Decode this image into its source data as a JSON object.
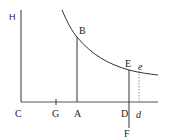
{
  "diagram": {
    "type": "hyperbola-asymptotes",
    "colors": {
      "stroke": "#333333",
      "background": "#ffffff"
    },
    "labels": {
      "H": "H",
      "C": "C",
      "G": "G",
      "A": "A",
      "B": "B",
      "D": "D",
      "E": "E",
      "F": "F",
      "e": "e",
      "d": "d"
    }
  }
}
